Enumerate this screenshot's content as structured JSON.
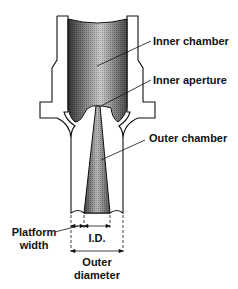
{
  "diagram": {
    "labels": {
      "inner_chamber": "Inner chamber",
      "inner_aperture": "Inner aperture",
      "outer_chamber": "Outer chamber",
      "platform_width_line1": "Platform",
      "platform_width_line2": "width",
      "inner_diameter": "I.D.",
      "outer_diameter_line1": "Outer",
      "outer_diameter_line2": "diameter"
    },
    "colors": {
      "outline": "#111111",
      "shade_dark": "#3a3a3a",
      "shade_light": "#d8d8d8",
      "background": "#ffffff"
    }
  }
}
